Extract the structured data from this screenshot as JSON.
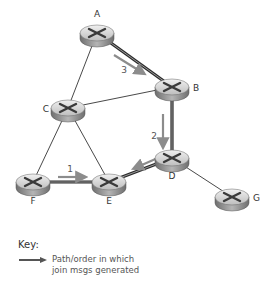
{
  "nodes": [
    {
      "id": "A",
      "label": "A"
    },
    {
      "id": "B",
      "label": "B"
    },
    {
      "id": "C",
      "label": "C"
    },
    {
      "id": "D",
      "label": "D"
    },
    {
      "id": "E",
      "label": "E"
    },
    {
      "id": "F",
      "label": "F"
    },
    {
      "id": "G",
      "label": "G"
    }
  ],
  "edges": [
    {
      "from": "A",
      "to": "B",
      "type": "join-path"
    },
    {
      "from": "A",
      "to": "C",
      "type": "normal"
    },
    {
      "from": "C",
      "to": "B",
      "type": "normal"
    },
    {
      "from": "B",
      "to": "D",
      "type": "join-path"
    },
    {
      "from": "C",
      "to": "F",
      "type": "normal"
    },
    {
      "from": "C",
      "to": "E",
      "type": "normal"
    },
    {
      "from": "F",
      "to": "E",
      "type": "join-path"
    },
    {
      "from": "E",
      "to": "D",
      "type": "join-path"
    },
    {
      "from": "D",
      "to": "G",
      "type": "normal"
    }
  ],
  "join_arrows": [
    {
      "order": "1",
      "from": "F",
      "to": "E"
    },
    {
      "order": "2",
      "from": "B",
      "to": "D"
    },
    {
      "order": "3",
      "from": "A",
      "to": "B"
    },
    {
      "order": "",
      "from": "D",
      "to": "E"
    }
  ],
  "key": {
    "title": "Key:",
    "line1": "Path/order in which",
    "line2": "join msgs generated"
  },
  "colors": {
    "normal_edge": "#333333",
    "join_edge": "#444444",
    "arrow": "#8c8c8c",
    "router_top": "#d9d9d9",
    "router_side": "#9a9a9a"
  }
}
